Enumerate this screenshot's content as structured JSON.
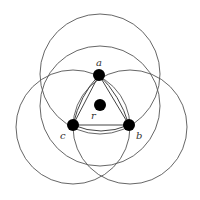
{
  "diagram": {
    "circles": [
      {
        "id": "circle-a",
        "cx": 100,
        "cy": 74,
        "r": 60
      },
      {
        "id": "circle-r",
        "cx": 100,
        "cy": 106,
        "r": 60
      },
      {
        "id": "circle-c",
        "cx": 73,
        "cy": 127,
        "r": 57
      },
      {
        "id": "circle-b",
        "cx": 130,
        "cy": 127,
        "r": 57
      }
    ],
    "nodes": [
      {
        "id": "a",
        "label": "a",
        "cx": 99,
        "cy": 75
      },
      {
        "id": "b",
        "label": "b",
        "cx": 129,
        "cy": 125
      },
      {
        "id": "c",
        "label": "c",
        "cx": 73,
        "cy": 125
      },
      {
        "id": "r",
        "label": "r",
        "cx": 100,
        "cy": 105
      }
    ],
    "labels": {
      "a": "a",
      "b": "b",
      "c": "c",
      "r": "r"
    },
    "colors": {
      "stroke": "#555555",
      "node": "#000000"
    }
  }
}
